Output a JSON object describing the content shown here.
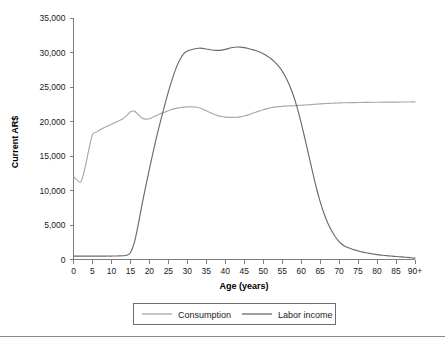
{
  "chart_data": {
    "type": "line",
    "title": "",
    "xlabel": "Age (years)",
    "ylabel": "Current AR$",
    "xlim": [
      0,
      90
    ],
    "ylim": [
      0,
      35000
    ],
    "grid": false,
    "legend_position": "bottom-center",
    "x_tick_labels": [
      "0",
      "5",
      "10",
      "15",
      "20",
      "25",
      "30",
      "35",
      "40",
      "45",
      "50",
      "55",
      "60",
      "65",
      "70",
      "75",
      "80",
      "85",
      "90+"
    ],
    "x_tick_values": [
      0,
      5,
      10,
      15,
      20,
      25,
      30,
      35,
      40,
      45,
      50,
      55,
      60,
      65,
      70,
      75,
      80,
      85,
      90
    ],
    "y_tick_labels": [
      "0",
      "5,000",
      "10,000",
      "15,000",
      "20,000",
      "25,000",
      "30,000",
      "35,000"
    ],
    "y_tick_values": [
      0,
      5000,
      10000,
      15000,
      20000,
      25000,
      30000,
      35000
    ],
    "x": [
      0,
      1,
      2,
      3,
      4,
      5,
      6,
      7,
      8,
      9,
      10,
      11,
      12,
      13,
      14,
      15,
      16,
      17,
      18,
      19,
      20,
      21,
      22,
      23,
      24,
      25,
      26,
      27,
      28,
      29,
      30,
      31,
      32,
      33,
      34,
      35,
      36,
      37,
      38,
      39,
      40,
      41,
      42,
      43,
      44,
      45,
      46,
      47,
      48,
      49,
      50,
      51,
      52,
      53,
      54,
      55,
      56,
      57,
      58,
      59,
      60,
      61,
      62,
      63,
      64,
      65,
      66,
      67,
      68,
      69,
      70,
      71,
      72,
      73,
      74,
      75,
      76,
      77,
      78,
      79,
      80,
      81,
      82,
      83,
      84,
      85,
      86,
      87,
      88,
      89,
      90
    ],
    "series": [
      {
        "name": "Consumption",
        "color": "#a8a8a8",
        "values": [
          12050,
          11500,
          11300,
          13200,
          15800,
          18100,
          18450,
          18800,
          19100,
          19350,
          19600,
          19850,
          20100,
          20400,
          20850,
          21400,
          21500,
          21050,
          20500,
          20350,
          20400,
          20650,
          20900,
          21150,
          21350,
          21550,
          21750,
          21900,
          22000,
          22080,
          22120,
          22130,
          22100,
          22000,
          21800,
          21550,
          21300,
          21050,
          20850,
          20720,
          20640,
          20600,
          20590,
          20610,
          20680,
          20800,
          20960,
          21140,
          21330,
          21520,
          21700,
          21860,
          21990,
          22080,
          22150,
          22200,
          22230,
          22260,
          22290,
          22320,
          22350,
          22390,
          22430,
          22470,
          22510,
          22550,
          22590,
          22620,
          22650,
          22670,
          22690,
          22710,
          22720,
          22730,
          22740,
          22750,
          22760,
          22770,
          22780,
          22785,
          22790,
          22795,
          22800,
          22805,
          22810,
          22815,
          22820,
          22825,
          22830,
          22835,
          22840
        ]
      },
      {
        "name": "Labor income",
        "color": "#6b6b6b",
        "values": [
          480,
          480,
          480,
          480,
          480,
          480,
          490,
          490,
          490,
          500,
          500,
          510,
          520,
          540,
          620,
          980,
          2400,
          4900,
          7800,
          10500,
          13100,
          15600,
          18000,
          20200,
          22300,
          24300,
          26100,
          27700,
          28900,
          29800,
          30200,
          30400,
          30550,
          30620,
          30600,
          30500,
          30400,
          30330,
          30300,
          30340,
          30450,
          30600,
          30720,
          30800,
          30780,
          30700,
          30580,
          30440,
          30280,
          30080,
          29820,
          29500,
          29120,
          28650,
          28050,
          27300,
          26350,
          25150,
          23700,
          21900,
          19800,
          17500,
          15100,
          12700,
          10400,
          8400,
          6700,
          5300,
          4200,
          3300,
          2600,
          2100,
          1800,
          1600,
          1400,
          1250,
          1100,
          980,
          880,
          790,
          710,
          640,
          580,
          530,
          480,
          430,
          390,
          350,
          310,
          260,
          200
        ]
      }
    ]
  },
  "legend": {
    "items": [
      {
        "label": "Consumption",
        "color": "#a8a8a8"
      },
      {
        "label": "Labor income",
        "color": "#6b6b6b"
      }
    ]
  },
  "axes": {
    "y_title": "Current AR$",
    "x_title": "Age (years)"
  }
}
